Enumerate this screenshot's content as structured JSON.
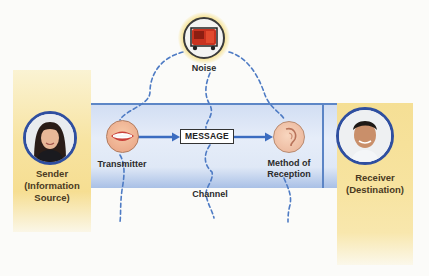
{
  "diagram": {
    "nodes": {
      "sender": {
        "label_line1": "Sender",
        "label_line2": "(Information",
        "label_line3": "Source)",
        "icon": "person-woman-avatar"
      },
      "transmitter": {
        "label": "Transmitter",
        "icon": "mouth-icon"
      },
      "message": {
        "label": "MESSAGE"
      },
      "reception": {
        "label_line1": "Method of",
        "label_line2": "Reception",
        "icon": "ear-icon"
      },
      "receiver": {
        "label_line1": "Receiver",
        "label_line2": "(Destination)",
        "icon": "person-man-avatar"
      },
      "noise": {
        "label": "Noise",
        "icon": "generator-icon"
      },
      "channel": {
        "label": "Channel"
      }
    },
    "edges": [
      {
        "from": "transmitter",
        "to": "message",
        "style": "solid-arrow"
      },
      {
        "from": "message",
        "to": "reception",
        "style": "solid-arrow"
      },
      {
        "from": "noise",
        "to": "transmitter",
        "style": "dashed"
      },
      {
        "from": "noise",
        "to": "message",
        "style": "dashed"
      },
      {
        "from": "noise",
        "to": "reception",
        "style": "dashed"
      }
    ],
    "colors": {
      "channel_blue": "#dfe8f6",
      "channel_border": "#5d86c6",
      "arrow_blue": "#3b6cc0",
      "dash_blue": "#4e7bc4",
      "column_yellow": "#f6de92",
      "avatar_ring": "#2f4fa0",
      "noise_glow": "#f6e08a"
    }
  }
}
